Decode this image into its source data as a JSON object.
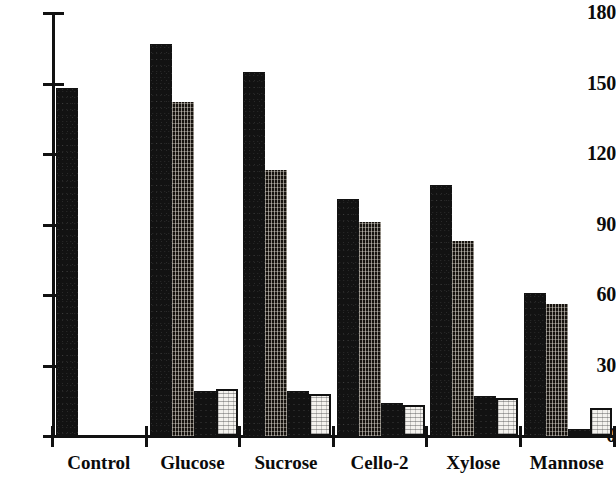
{
  "chart_data": {
    "type": "bar",
    "title": "",
    "subtitle": "",
    "xlabel": "",
    "ylabel": "",
    "grid": false,
    "legend": "none",
    "ylim": [
      0,
      180
    ],
    "yticks": [
      0,
      30,
      60,
      90,
      120,
      150,
      180
    ],
    "ytick_labels": [
      "0",
      "30",
      "60",
      "90",
      "120",
      "150",
      "180"
    ],
    "categories": [
      "Control",
      "Glucose",
      "Sucrose",
      "Cello-2",
      "Xylose",
      "Mannose"
    ],
    "series": [
      {
        "name": "series-1",
        "style": "solid-dark",
        "values": [
          148,
          167,
          155,
          101,
          107,
          61
        ]
      },
      {
        "name": "series-2",
        "style": "hatched-dark",
        "values": [
          null,
          142,
          113,
          91,
          83,
          56
        ]
      },
      {
        "name": "series-3",
        "style": "small-dark",
        "values": [
          null,
          19,
          19,
          14,
          17,
          3
        ]
      },
      {
        "name": "series-4",
        "style": "light-outlined",
        "values": [
          null,
          20,
          18,
          13,
          16,
          12
        ]
      }
    ]
  },
  "axis": {
    "y_tick_labels": [
      "180",
      "150",
      "120",
      "90",
      "60",
      "30",
      "0"
    ],
    "x_category_labels": [
      "Control",
      "Glucose",
      "Sucrose",
      "Cello-2",
      "Xylose",
      "Mannose"
    ]
  },
  "colors": {
    "axis": "#111111",
    "series_solid_dark": "#121212",
    "series_hatched": "#17130f",
    "series_small_dark": "#121212",
    "series_light_fill": "#f4f2ee",
    "series_light_border": "#111111",
    "background": "#ffffff"
  }
}
